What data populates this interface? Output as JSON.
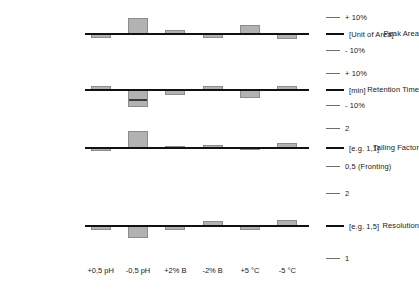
{
  "chart_data": {
    "type": "bar",
    "title": "",
    "subtitle": "",
    "xlabel": "",
    "ylabel": "",
    "grid": false,
    "legend_position": "right",
    "orientation": "vertical",
    "note": "Robustness test: deviation of four chromatographic responses for six deliberate method variations. Bars are signed deviations from the nominal value (baseline = 0).",
    "categories": [
      "+0,5 pH",
      "-0,5 pH",
      "+2% B",
      "-2% B",
      "+5 °C",
      "-5 °C"
    ],
    "series": [
      {
        "name": "Peak Area",
        "unit_label": "[Unit of Area]",
        "upper_label": "+ 10%",
        "lower_label": "- 10%",
        "values": [
          -2.6,
          10.5,
          2.4,
          -2.4,
          6.0,
          -3.4
        ]
      },
      {
        "name": "Retention Time",
        "unit_label": "[min]",
        "upper_label": "+ 10%",
        "lower_label": "- 10%",
        "values": [
          2.4,
          -11.0,
          -3.4,
          2.6,
          -5.4,
          2.6
        ]
      },
      {
        "name": "Tailing Factor",
        "unit_label": "[e.g. 1,1]",
        "upper_label": "2",
        "lower_label": "0,5 (Fronting)",
        "values": [
          -2.0,
          11.0,
          1.6,
          2.0,
          -1.6,
          3.4
        ]
      },
      {
        "name": "Resolution",
        "unit_label": "[e.g. 1,5]",
        "upper_label": "2",
        "lower_label": "1",
        "values": [
          -2.6,
          -7.6,
          -2.4,
          3.4,
          -2.4,
          3.6
        ]
      }
    ]
  },
  "rows": [
    {
      "label": "Peak Area",
      "legend": [
        {
          "text": "+ 10%",
          "style": "tick"
        },
        {
          "text": "[Unit of Area]",
          "style": "strong"
        },
        {
          "text": "- 10%",
          "style": "tick"
        }
      ]
    },
    {
      "label": "Retention Time",
      "legend": [
        {
          "text": "+ 10%",
          "style": "tick"
        },
        {
          "text": "[min]",
          "style": "strong"
        },
        {
          "text": "- 10%",
          "style": "tick"
        }
      ]
    },
    {
      "label": "Tailing Factor",
      "legend": [
        {
          "text": "2",
          "style": "tick"
        },
        {
          "text": "[e.g. 1,1]",
          "style": "strong"
        },
        {
          "text": "0,5 (Fronting)",
          "style": "tick"
        }
      ]
    },
    {
      "label": "Resolution",
      "legend": [
        {
          "text": "2",
          "style": "tick"
        },
        {
          "text": "[e.g. 1,5]",
          "style": "strong"
        },
        {
          "text": "1",
          "style": "tick"
        }
      ]
    }
  ],
  "xaxis": {
    "labels": [
      "+0,5 pH",
      "-0,5 pH",
      "+2% B",
      "-2% B",
      "+5 °C",
      "-5 °C"
    ]
  },
  "colors": {
    "bar_fill": "#b2b2b2",
    "bar_stroke": "#8c8c8c",
    "baseline": "#111111",
    "tick": "#6e6e6e",
    "text": "#1a1a1a",
    "background": "#ffffff"
  }
}
